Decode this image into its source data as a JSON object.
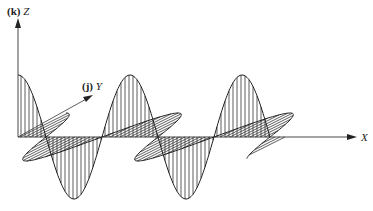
{
  "diagram": {
    "type": "electromagnetic-wave",
    "axes": {
      "z": {
        "label": "Z",
        "unit_vector": "(k)"
      },
      "y": {
        "label": "Y",
        "unit_vector": "(j)"
      },
      "x": {
        "label": "X"
      }
    },
    "waves": [
      {
        "name": "z-component",
        "hatch": "vertical",
        "plane": "XZ"
      },
      {
        "name": "y-component",
        "hatch": "diagonal",
        "plane": "XY"
      }
    ],
    "colors": {
      "line": "#222222",
      "background": "#ffffff"
    }
  }
}
